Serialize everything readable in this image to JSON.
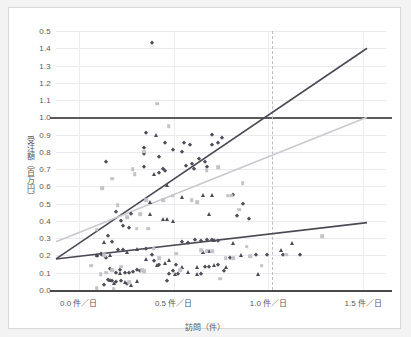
{
  "chart_data": {
    "type": "scatter",
    "title": "",
    "xlabel": "訪問（件）",
    "ylabel": "受注額（百万円）",
    "xlim": [
      -0.12,
      1.62
    ],
    "ylim": [
      0.0,
      1.5
    ],
    "grid": true,
    "legend_position": "none",
    "y_ticks": [
      "0.0",
      "0.1",
      "0.2",
      "0.3",
      "0.4",
      "0.5",
      "0.6",
      "0.7",
      "0.8",
      "0.9",
      "1.0",
      "1.1",
      "1.2",
      "1.3",
      "1.4",
      "0.5"
    ],
    "y_tick_values": [
      0.0,
      0.1,
      0.2,
      0.3,
      0.4,
      0.5,
      0.6,
      0.7,
      0.8,
      0.9,
      1.0,
      1.1,
      1.2,
      1.3,
      1.4,
      1.5
    ],
    "x_ticks": [
      "0.0 件／日",
      "0.5 件／日",
      "1.0 件／日",
      "1.5 件／日"
    ],
    "x_tick_values": [
      0.0,
      0.5,
      1.0,
      1.5
    ],
    "annotations": [
      {
        "name": "reference-line-horizontal",
        "type": "hline",
        "y": 1.0,
        "color": "#5a5a5a",
        "style": "solid"
      },
      {
        "name": "reference-line-vertical",
        "type": "vline",
        "x": 1.02,
        "color": "#bdbdbd",
        "style": "dashed"
      }
    ],
    "series": [
      {
        "name": "trend-line-steep",
        "type": "line",
        "color": "#4a4a55",
        "x": [
          -0.12,
          1.52
        ],
        "values": [
          0.18,
          1.4
        ]
      },
      {
        "name": "trend-line-mid",
        "type": "line",
        "color": "#c9c9cf",
        "x": [
          -0.12,
          1.52
        ],
        "values": [
          0.28,
          1.0
        ]
      },
      {
        "name": "trend-line-shallow",
        "type": "line",
        "color": "#4a4a55",
        "x": [
          -0.12,
          1.52
        ],
        "values": [
          0.18,
          0.39
        ]
      },
      {
        "name": "points-diamond",
        "type": "scatter",
        "marker": "diamond",
        "color": "#4f4f5a",
        "points": [
          [
            0.145,
            0.74
          ],
          [
            0.385,
            1.43
          ],
          [
            0.355,
            0.91
          ],
          [
            0.345,
            0.82
          ],
          [
            0.345,
            0.79
          ],
          [
            0.455,
            0.85
          ],
          [
            0.425,
            0.77
          ],
          [
            0.495,
            0.81
          ],
          [
            0.545,
            0.8
          ],
          [
            0.555,
            0.85
          ],
          [
            0.585,
            0.84
          ],
          [
            0.565,
            0.72
          ],
          [
            0.595,
            0.73
          ],
          [
            0.605,
            0.7
          ],
          [
            0.635,
            0.76
          ],
          [
            0.665,
            0.74
          ],
          [
            0.675,
            0.71
          ],
          [
            0.705,
            0.9
          ],
          [
            0.755,
            0.88
          ],
          [
            0.735,
            0.85
          ],
          [
            0.705,
            0.84
          ],
          [
            0.445,
            0.7
          ],
          [
            0.455,
            0.69
          ],
          [
            0.425,
            0.68
          ],
          [
            0.345,
            0.71
          ],
          [
            0.195,
            0.45
          ],
          [
            0.225,
            0.4
          ],
          [
            0.235,
            0.37
          ],
          [
            0.265,
            0.36
          ],
          [
            0.275,
            0.44
          ],
          [
            0.155,
            0.31
          ],
          [
            0.175,
            0.28
          ],
          [
            0.205,
            0.23
          ],
          [
            0.235,
            0.23
          ],
          [
            0.115,
            0.21
          ],
          [
            0.125,
            0.205
          ],
          [
            0.095,
            0.195
          ],
          [
            0.145,
            0.185
          ],
          [
            0.165,
            0.12
          ],
          [
            0.195,
            0.1
          ],
          [
            0.215,
            0.115
          ],
          [
            0.245,
            0.1
          ],
          [
            0.265,
            0.1
          ],
          [
            0.225,
            0.055
          ],
          [
            0.195,
            0.045
          ],
          [
            0.175,
            0.05
          ],
          [
            0.155,
            0.06
          ],
          [
            0.135,
            0.03
          ],
          [
            0.255,
            0.035
          ],
          [
            0.285,
            0.105
          ],
          [
            0.305,
            0.115
          ],
          [
            0.325,
            0.11
          ],
          [
            0.355,
            0.235
          ],
          [
            0.385,
            0.2
          ],
          [
            0.395,
            0.17
          ],
          [
            0.425,
            0.145
          ],
          [
            0.465,
            0.05
          ],
          [
            0.495,
            0.11
          ],
          [
            0.515,
            0.145
          ],
          [
            0.545,
            0.28
          ],
          [
            0.575,
            0.27
          ],
          [
            0.615,
            0.29
          ],
          [
            0.645,
            0.285
          ],
          [
            0.675,
            0.29
          ],
          [
            0.705,
            0.29
          ],
          [
            0.735,
            0.285
          ],
          [
            0.645,
            0.09
          ],
          [
            0.665,
            0.135
          ],
          [
            0.685,
            0.135
          ],
          [
            0.735,
            0.145
          ],
          [
            0.765,
            0.11
          ],
          [
            0.795,
            0.185
          ],
          [
            0.835,
            0.43
          ],
          [
            0.815,
            0.55
          ],
          [
            0.865,
            0.5
          ],
          [
            0.895,
            0.41
          ],
          [
            0.935,
            0.2
          ],
          [
            0.995,
            0.2
          ],
          [
            1.075,
            0.2
          ],
          [
            1.165,
            0.205
          ],
          [
            0.525,
            0.095
          ],
          [
            0.475,
            0.095
          ]
        ]
      },
      {
        "name": "points-triangle",
        "type": "scatter",
        "marker": "triangle",
        "color": "#4a4a55",
        "points": [
          [
            0.405,
            0.9
          ],
          [
            0.395,
            0.67
          ],
          [
            0.375,
            0.51
          ],
          [
            0.375,
            0.44
          ],
          [
            0.445,
            0.41
          ],
          [
            0.465,
            0.41
          ],
          [
            0.495,
            0.4
          ],
          [
            0.465,
            0.61
          ],
          [
            0.545,
            0.54
          ],
          [
            0.685,
            0.44
          ],
          [
            0.655,
            0.55
          ],
          [
            0.705,
            0.55
          ],
          [
            0.815,
            0.27
          ],
          [
            0.855,
            0.2
          ],
          [
            0.945,
            0.09
          ],
          [
            1.125,
            0.27
          ],
          [
            1.065,
            0.23
          ],
          [
            0.135,
            0.28
          ],
          [
            0.095,
            0.205
          ],
          [
            0.165,
            0.2
          ],
          [
            0.255,
            0.22
          ],
          [
            0.305,
            0.235
          ],
          [
            0.215,
            0.1
          ],
          [
            0.245,
            0.045
          ],
          [
            0.185,
            0.04
          ],
          [
            0.165,
            0.06
          ],
          [
            0.355,
            0.18
          ],
          [
            0.415,
            0.145
          ],
          [
            0.545,
            0.135
          ],
          [
            0.575,
            0.105
          ],
          [
            0.625,
            0.135
          ],
          [
            0.655,
            0.22
          ],
          [
            0.685,
            0.225
          ],
          [
            0.715,
            0.29
          ],
          [
            0.775,
            0.135
          ],
          [
            0.715,
            0.145
          ],
          [
            0.625,
            0.095
          ],
          [
            0.505,
            0.09
          ],
          [
            0.305,
            0.055
          ],
          [
            0.275,
            0.03
          ],
          [
            0.455,
            0.155
          ],
          [
            0.475,
            0.175
          ]
        ]
      },
      {
        "name": "points-square-light",
        "type": "scatter",
        "marker": "square",
        "color": "#c3c3c9",
        "points": [
          [
            0.125,
            0.59
          ],
          [
            0.175,
            0.645
          ],
          [
            0.285,
            0.7
          ],
          [
            0.295,
            0.67
          ],
          [
            0.325,
            0.44
          ],
          [
            0.345,
            0.8
          ],
          [
            0.415,
            1.08
          ],
          [
            0.475,
            0.95
          ],
          [
            0.495,
            0.545
          ],
          [
            0.445,
            0.52
          ],
          [
            0.355,
            0.52
          ],
          [
            0.365,
            0.355
          ],
          [
            0.305,
            0.355
          ],
          [
            0.255,
            0.42
          ],
          [
            0.205,
            0.49
          ],
          [
            0.095,
            0.35
          ],
          [
            0.065,
            0.14
          ],
          [
            0.095,
            0.01
          ],
          [
            0.115,
            0.09
          ],
          [
            0.145,
            0.1
          ],
          [
            0.175,
            0.115
          ],
          [
            0.135,
            0.2
          ],
          [
            0.595,
            0.52
          ],
          [
            0.625,
            0.51
          ],
          [
            0.675,
            0.695
          ],
          [
            0.735,
            0.71
          ],
          [
            0.785,
            0.545
          ],
          [
            0.805,
            0.545
          ],
          [
            0.865,
            0.62
          ],
          [
            0.845,
            0.465
          ],
          [
            0.885,
            0.25
          ],
          [
            0.905,
            0.195
          ],
          [
            0.965,
            0.14
          ],
          [
            1.285,
            0.31
          ],
          [
            1.095,
            0.205
          ],
          [
            0.815,
            0.185
          ],
          [
            0.775,
            0.185
          ],
          [
            0.745,
            0.065
          ],
          [
            0.705,
            0.225
          ],
          [
            0.675,
            0.225
          ],
          [
            0.645,
            0.23
          ],
          [
            0.515,
            0.21
          ],
          [
            0.535,
            0.115
          ],
          [
            0.425,
            0.185
          ],
          [
            0.395,
            0.24
          ],
          [
            0.345,
            0.11
          ],
          [
            0.225,
            0.135
          ],
          [
            0.265,
            0.045
          ],
          [
            0.185,
            0.005
          ],
          [
            0.335,
            0.115
          ]
        ]
      }
    ]
  }
}
